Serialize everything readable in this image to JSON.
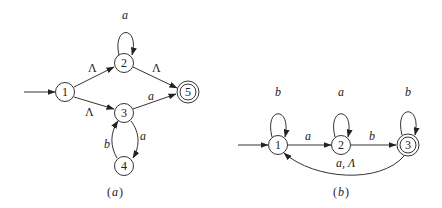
{
  "diagrams": [
    {
      "caption": "(a)",
      "caption_main": "a",
      "states": [
        {
          "id": "1",
          "label": "1",
          "start": true,
          "accepting": false
        },
        {
          "id": "2",
          "label": "2",
          "start": false,
          "accepting": false
        },
        {
          "id": "3",
          "label": "3",
          "start": false,
          "accepting": false
        },
        {
          "id": "4",
          "label": "4",
          "start": false,
          "accepting": false
        },
        {
          "id": "5",
          "label": "5",
          "start": false,
          "accepting": true
        }
      ],
      "transitions": [
        {
          "from": "1",
          "to": "2",
          "label": "Λ"
        },
        {
          "from": "1",
          "to": "3",
          "label": "Λ"
        },
        {
          "from": "2",
          "to": "2",
          "label": "a"
        },
        {
          "from": "2",
          "to": "5",
          "label": "Λ"
        },
        {
          "from": "3",
          "to": "5",
          "label": "a"
        },
        {
          "from": "3",
          "to": "4",
          "label": "a"
        },
        {
          "from": "4",
          "to": "3",
          "label": "b"
        }
      ]
    },
    {
      "caption": "(b)",
      "caption_main": "b",
      "states": [
        {
          "id": "1",
          "label": "1",
          "start": true,
          "accepting": false
        },
        {
          "id": "2",
          "label": "2",
          "start": false,
          "accepting": false
        },
        {
          "id": "3",
          "label": "3",
          "start": false,
          "accepting": true
        }
      ],
      "transitions": [
        {
          "from": "1",
          "to": "1",
          "label": "b"
        },
        {
          "from": "1",
          "to": "2",
          "label": "a"
        },
        {
          "from": "2",
          "to": "2",
          "label": "a"
        },
        {
          "from": "2",
          "to": "3",
          "label": "b"
        },
        {
          "from": "3",
          "to": "3",
          "label": "b"
        },
        {
          "from": "3",
          "to": "1",
          "label": "a, Λ"
        }
      ]
    }
  ]
}
